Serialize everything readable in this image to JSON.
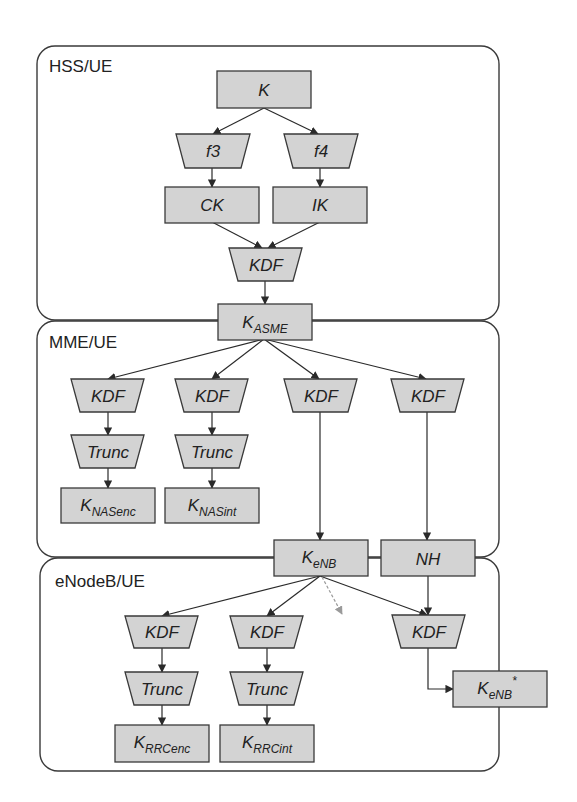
{
  "diagram": {
    "colors": {
      "node_fill": "#d3d3d3",
      "stroke": "#3a3a3a",
      "dashed_arrow": "#9a9a9a",
      "background": "#ffffff"
    },
    "regions": [
      {
        "id": "hss",
        "label": "HSS/UE"
      },
      {
        "id": "mme",
        "label": "MME/UE"
      },
      {
        "id": "enb",
        "label": "eNodeB/UE"
      }
    ],
    "nodes": {
      "K": {
        "main": "K",
        "sub": "",
        "sup": "",
        "shape": "rect"
      },
      "f3": {
        "main": "f3",
        "sub": "",
        "sup": "",
        "shape": "trapezoid"
      },
      "f4": {
        "main": "f4",
        "sub": "",
        "sup": "",
        "shape": "trapezoid"
      },
      "CK": {
        "main": "CK",
        "sub": "",
        "sup": "",
        "shape": "rect"
      },
      "IK": {
        "main": "IK",
        "sub": "",
        "sup": "",
        "shape": "rect"
      },
      "kdf_hss": {
        "main": "KDF",
        "sub": "",
        "sup": "",
        "shape": "trapezoid"
      },
      "KASME": {
        "main": "K",
        "sub": "ASME",
        "sup": "",
        "shape": "rect"
      },
      "kdf_mme_1": {
        "main": "KDF",
        "sub": "",
        "sup": "",
        "shape": "trapezoid"
      },
      "kdf_mme_2": {
        "main": "KDF",
        "sub": "",
        "sup": "",
        "shape": "trapezoid"
      },
      "kdf_mme_3": {
        "main": "KDF",
        "sub": "",
        "sup": "",
        "shape": "trapezoid"
      },
      "kdf_mme_4": {
        "main": "KDF",
        "sub": "",
        "sup": "",
        "shape": "trapezoid"
      },
      "trunc_mme_1": {
        "main": "Trunc",
        "sub": "",
        "sup": "",
        "shape": "trapezoid"
      },
      "trunc_mme_2": {
        "main": "Trunc",
        "sub": "",
        "sup": "",
        "shape": "trapezoid"
      },
      "KNASenc": {
        "main": "K",
        "sub": "NASenc",
        "sup": "",
        "shape": "rect"
      },
      "KNASint": {
        "main": "K",
        "sub": "NASint",
        "sup": "",
        "shape": "rect"
      },
      "KeNB": {
        "main": "K",
        "sub": "eNB",
        "sup": "",
        "shape": "rect"
      },
      "NH": {
        "main": "NH",
        "sub": "",
        "sup": "",
        "shape": "rect"
      },
      "kdf_enb_1": {
        "main": "KDF",
        "sub": "",
        "sup": "",
        "shape": "trapezoid"
      },
      "kdf_enb_2": {
        "main": "KDF",
        "sub": "",
        "sup": "",
        "shape": "trapezoid"
      },
      "kdf_enb_3": {
        "main": "KDF",
        "sub": "",
        "sup": "",
        "shape": "trapezoid"
      },
      "trunc_enb_1": {
        "main": "Trunc",
        "sub": "",
        "sup": "",
        "shape": "trapezoid"
      },
      "trunc_enb_2": {
        "main": "Trunc",
        "sub": "",
        "sup": "",
        "shape": "trapezoid"
      },
      "KRRCenc": {
        "main": "K",
        "sub": "RRCenc",
        "sup": "",
        "shape": "rect"
      },
      "KRRCint": {
        "main": "K",
        "sub": "RRCint",
        "sup": "",
        "shape": "rect"
      },
      "KeNBstar": {
        "main": "K",
        "sub": "eNB",
        "sup": "*",
        "shape": "rect"
      }
    },
    "edges": [
      {
        "from": "K",
        "to": "f3"
      },
      {
        "from": "K",
        "to": "f4"
      },
      {
        "from": "f3",
        "to": "CK"
      },
      {
        "from": "f4",
        "to": "IK"
      },
      {
        "from": "CK",
        "to": "kdf_hss"
      },
      {
        "from": "IK",
        "to": "kdf_hss"
      },
      {
        "from": "kdf_hss",
        "to": "KASME"
      },
      {
        "from": "KASME",
        "to": "kdf_mme_1"
      },
      {
        "from": "KASME",
        "to": "kdf_mme_2"
      },
      {
        "from": "KASME",
        "to": "kdf_mme_3"
      },
      {
        "from": "KASME",
        "to": "kdf_mme_4"
      },
      {
        "from": "kdf_mme_1",
        "to": "trunc_mme_1"
      },
      {
        "from": "kdf_mme_2",
        "to": "trunc_mme_2"
      },
      {
        "from": "trunc_mme_1",
        "to": "KNASenc"
      },
      {
        "from": "trunc_mme_2",
        "to": "KNASint"
      },
      {
        "from": "kdf_mme_3",
        "to": "KeNB"
      },
      {
        "from": "kdf_mme_4",
        "to": "NH"
      },
      {
        "from": "KeNB",
        "to": "kdf_enb_1"
      },
      {
        "from": "KeNB",
        "to": "kdf_enb_2"
      },
      {
        "from": "KeNB",
        "to": "kdf_enb_3"
      },
      {
        "from": "KeNB",
        "to": "(unlabeled)",
        "style": "dashed"
      },
      {
        "from": "NH",
        "to": "kdf_enb_3"
      },
      {
        "from": "kdf_enb_1",
        "to": "trunc_enb_1"
      },
      {
        "from": "kdf_enb_2",
        "to": "trunc_enb_2"
      },
      {
        "from": "trunc_enb_1",
        "to": "KRRCenc"
      },
      {
        "from": "trunc_enb_2",
        "to": "KRRCint"
      },
      {
        "from": "kdf_enb_3",
        "to": "KeNBstar"
      }
    ]
  }
}
